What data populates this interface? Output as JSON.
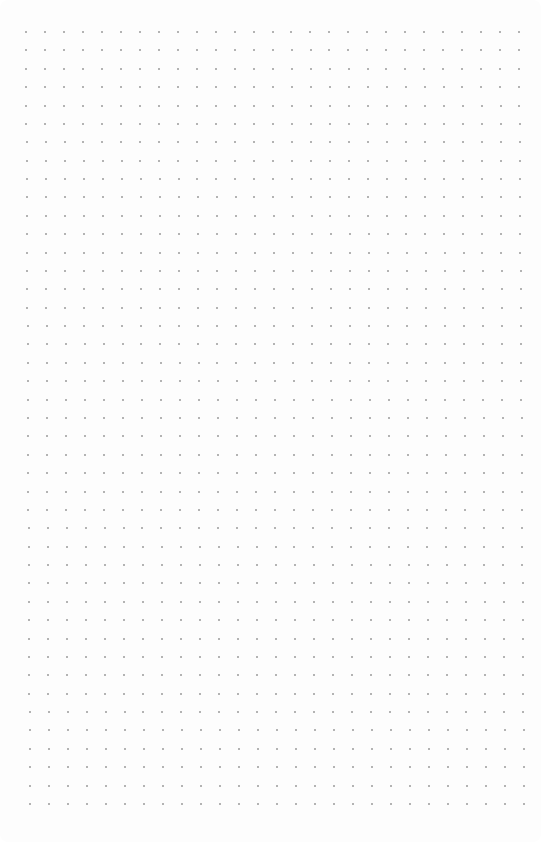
{
  "page": {
    "type": "dot-grid-paper",
    "background": "#fdfdfd",
    "dot_color": "#9a9a9a"
  },
  "grid": {
    "columns": 27,
    "rows": 43,
    "top_left": [
      26,
      32
    ],
    "top_right": [
      519,
      32
    ],
    "bottom_left": [
      30,
      804
    ],
    "bottom_right": [
      524,
      804
    ],
    "dot_size": 2
  }
}
